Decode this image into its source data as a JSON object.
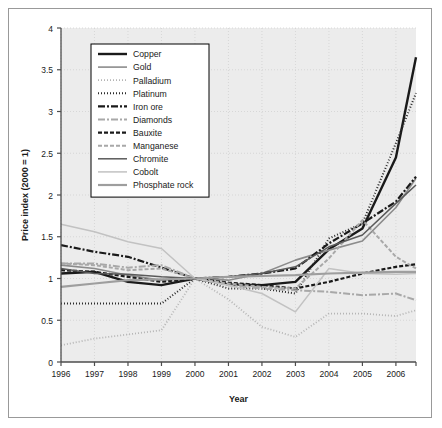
{
  "figure": {
    "background": "#ffffff",
    "frame_color": "#999999",
    "plot_background": "#ececec",
    "grid_color": "#d2d2d2",
    "axis_color": "#4d4d4d"
  },
  "axes": {
    "ylabel": "Price index (2000 = 1)",
    "xlabel": "Year",
    "yticks": [
      "0",
      "0.5",
      "1",
      "1.5",
      "2",
      "2.5",
      "3",
      "3.5",
      "4"
    ],
    "xticks": [
      "1996",
      "1997",
      "1998",
      "1999",
      "2000",
      "2001",
      "2002",
      "2003",
      "2004",
      "2005",
      "2006"
    ],
    "ylim": [
      0,
      4
    ],
    "xlim": [
      1996,
      2006.6
    ]
  },
  "legend": {
    "position": "top-left-inside",
    "border_color": "#000000",
    "background": "#ffffff",
    "entries": [
      {
        "label": "Copper",
        "color": "#1a1a1a",
        "width": 2.4,
        "dash": "none"
      },
      {
        "label": "Gold",
        "color": "#8c8c8c",
        "width": 1.6,
        "dash": "none"
      },
      {
        "label": "Palladium",
        "color": "#b5b5b5",
        "width": 1.8,
        "dash": "1,2"
      },
      {
        "label": "Platinum",
        "color": "#2b2b2b",
        "width": 2.0,
        "dash": "1,2"
      },
      {
        "label": "Iron ore",
        "color": "#1a1a1a",
        "width": 2.2,
        "dash": "7,2,2,2"
      },
      {
        "label": "Diamonds",
        "color": "#a8a8a8",
        "width": 2.0,
        "dash": "7,2,2,2"
      },
      {
        "label": "Bauxite",
        "color": "#1a1a1a",
        "width": 2.2,
        "dash": "4,2"
      },
      {
        "label": "Manganese",
        "color": "#a8a8a8",
        "width": 2.0,
        "dash": "4,2"
      },
      {
        "label": "Chromite",
        "color": "#5a5a5a",
        "width": 1.5,
        "dash": "none"
      },
      {
        "label": "Cobolt",
        "color": "#c2c2c2",
        "width": 1.5,
        "dash": "none"
      },
      {
        "label": "Phosphate rock",
        "color": "#9e9e9e",
        "width": 2.2,
        "dash": "none"
      }
    ]
  },
  "chart_data": {
    "type": "line",
    "title": "",
    "xlabel": "Year",
    "ylabel": "Price index (2000 = 1)",
    "xlim": [
      1996,
      2006.6
    ],
    "ylim": [
      0,
      4
    ],
    "grid": true,
    "legend_position": "top-left-inside",
    "x": [
      1996,
      1997,
      1998,
      1999,
      2000,
      2001,
      2002,
      2003,
      2004,
      2005,
      2006,
      2006.6
    ],
    "series": [
      {
        "name": "Copper",
        "values": [
          1.06,
          1.08,
          0.96,
          0.92,
          1.0,
          0.93,
          0.92,
          0.96,
          1.35,
          1.6,
          2.45,
          3.65
        ]
      },
      {
        "name": "Gold",
        "values": [
          1.16,
          1.12,
          1.04,
          0.98,
          1.0,
          0.98,
          1.06,
          1.22,
          1.34,
          1.45,
          1.85,
          2.2
        ]
      },
      {
        "name": "Palladium",
        "values": [
          0.2,
          0.28,
          0.33,
          0.38,
          1.0,
          0.75,
          0.42,
          0.3,
          0.58,
          0.58,
          0.55,
          0.62
        ]
      },
      {
        "name": "Platinum",
        "values": [
          0.7,
          0.7,
          0.7,
          0.7,
          1.0,
          0.88,
          0.88,
          0.82,
          1.48,
          1.66,
          2.62,
          3.22
        ]
      },
      {
        "name": "Iron ore",
        "values": [
          1.4,
          1.32,
          1.26,
          1.13,
          1.0,
          1.02,
          1.06,
          1.12,
          1.42,
          1.66,
          1.92,
          2.22
        ]
      },
      {
        "name": "Diamonds",
        "values": [
          1.18,
          1.18,
          1.13,
          1.16,
          1.0,
          0.92,
          0.88,
          0.86,
          0.84,
          0.8,
          0.82,
          0.74
        ]
      },
      {
        "name": "Bauxite",
        "values": [
          1.1,
          1.08,
          1.02,
          0.96,
          1.0,
          0.95,
          0.92,
          0.88,
          0.96,
          1.06,
          1.14,
          1.17
        ]
      },
      {
        "name": "Manganese",
        "values": [
          1.18,
          1.16,
          1.1,
          1.12,
          1.0,
          0.94,
          0.9,
          0.88,
          1.24,
          1.7,
          1.26,
          1.12
        ]
      },
      {
        "name": "Chromite",
        "values": [
          1.12,
          1.06,
          1.05,
          1.02,
          1.0,
          1.02,
          1.06,
          1.14,
          1.38,
          1.52,
          1.9,
          2.12
        ]
      },
      {
        "name": "Cobolt",
        "values": [
          1.65,
          1.56,
          1.44,
          1.36,
          1.0,
          0.92,
          0.82,
          0.6,
          1.12,
          1.06,
          1.05,
          1.06
        ]
      },
      {
        "name": "Phosphate rock",
        "values": [
          0.9,
          0.94,
          0.98,
          0.99,
          1.0,
          1.02,
          1.03,
          1.04,
          1.06,
          1.07,
          1.08,
          1.08
        ]
      }
    ]
  }
}
